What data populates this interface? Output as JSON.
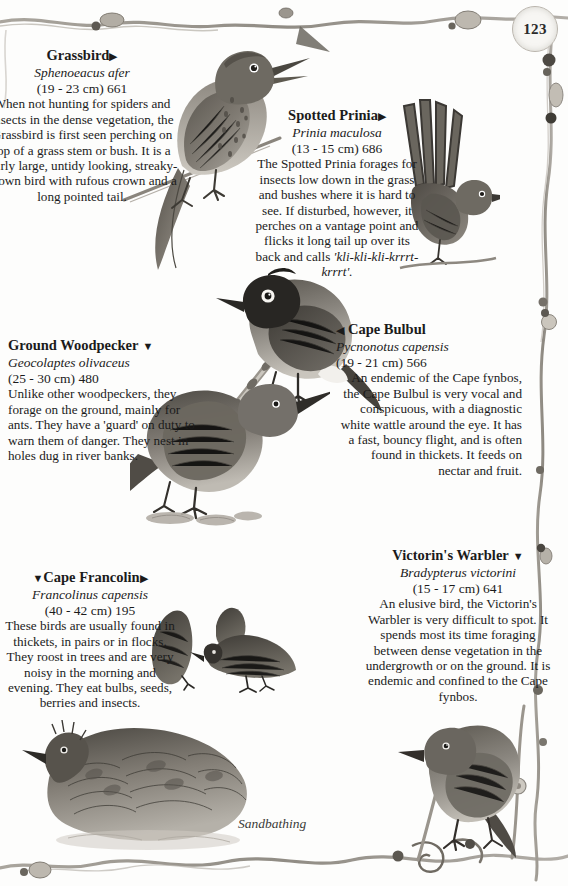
{
  "page": {
    "number": "123",
    "caption_sandbathing": "Sandbathing"
  },
  "species": [
    {
      "id": "grassbird",
      "name": "Grassbird",
      "marker_after": "▶",
      "marker_before": "",
      "latin": "Sphenoeacus afer",
      "measurement": "(19 - 23 cm) 661",
      "description": "When not hunting for spiders and insects in the dense vegetation, the Grassbird is first seen perching on top of a grass stem or bush. It is a fairly large, untidy looking, streaky-brown bird with rufous crown and a long pointed tail."
    },
    {
      "id": "prinia",
      "name": "Spotted Prinia",
      "marker_after": "▶",
      "marker_before": "",
      "latin": "Prinia maculosa",
      "measurement": "(13 - 15 cm) 686",
      "description": "The Spotted Prinia forages for insects low down in the grass and bushes where it is hard to see. If disturbed, however, it perches on a vantage point and flicks it long tail up over its back and calls ",
      "call": "'kli-kli-kli-krrrt-krrrt'."
    },
    {
      "id": "bulbul",
      "name": "Cape Bulbul",
      "marker_after": "",
      "marker_before": "◀",
      "latin": "Pycnonotus capensis",
      "measurement": "(19 - 21 cm) 566",
      "description": "An endemic of the Cape fynbos, the Cape Bulbul is very vocal and conspicuous, with a diagnostic white wattle around the eye. It has a fast, bouncy flight, and is often found in thickets. It feeds on nectar and fruit."
    },
    {
      "id": "woodpecker",
      "name": "Ground Woodpecker",
      "marker_after": "▼",
      "marker_before": "",
      "latin": "Geocolaptes olivaceus",
      "measurement": "(25 - 30 cm) 480",
      "description": "Unlike other woodpeckers, they forage on the ground, mainly for ants. They have a 'guard' on duty to warn them of danger. They nest in holes dug in river banks."
    },
    {
      "id": "francolin",
      "name": "Cape Francolin",
      "marker_after": "▶",
      "marker_before": "▼",
      "latin": "Francolinus capensis",
      "measurement": "(40 - 42 cm) 195",
      "description": "These birds are usually found in thickets, in pairs or in flocks. They roost in trees and are very noisy in the morning and evening. They eat bulbs, seeds, berries and insects."
    },
    {
      "id": "victorin",
      "name": "Victorin's Warbler",
      "marker_after": "▼",
      "marker_before": "",
      "latin": "Bradypterus victorini",
      "measurement": "(15 - 17 cm) 641",
      "description": "An elusive bird, the Victorin's Warbler is very difficult to spot. It spends most its time foraging between dense vegetation in the undergrowth or on the ground. It is endemic and confined to the Cape fynbos."
    }
  ],
  "illustrations": [
    {
      "id": "grassbird-art",
      "label": "grassbird-illustration"
    },
    {
      "id": "prinia-art",
      "label": "spotted-prinia-illustration"
    },
    {
      "id": "bulbul-art",
      "label": "cape-bulbul-illustration"
    },
    {
      "id": "woodpecker-art",
      "label": "ground-woodpecker-illustration"
    },
    {
      "id": "francolin-small-art",
      "label": "cape-francolin-pair-illustration"
    },
    {
      "id": "francolin-large-art",
      "label": "cape-francolin-sandbathing-illustration"
    },
    {
      "id": "victorin-art",
      "label": "victorins-warbler-illustration"
    }
  ],
  "colors": {
    "paper": "#fdfdfc",
    "ink": "#1b1b1b",
    "vine": "#8d8880",
    "art_dark": "#3a3733",
    "art_mid": "#6f6b64",
    "art_light": "#a8a49c"
  }
}
